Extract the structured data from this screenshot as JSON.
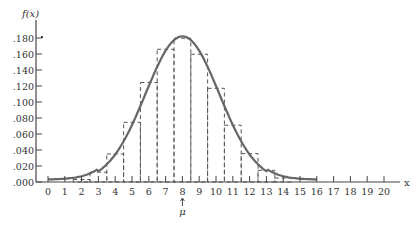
{
  "chart_data": {
    "type": "bar",
    "title": "",
    "xlabel": "x",
    "ylabel": "f(x)",
    "mu_label": "μ",
    "mu_value": 8,
    "categories": [
      0,
      1,
      2,
      3,
      4,
      5,
      6,
      7,
      8,
      9,
      10,
      11,
      12,
      13,
      14,
      15,
      16,
      17,
      18,
      19,
      20
    ],
    "x_tick_labels": [
      "0",
      "1",
      "2",
      "3",
      "4",
      "5",
      "6",
      "7",
      "8",
      "9",
      "10",
      "11",
      "12",
      "13",
      "14",
      "15",
      "16",
      "17",
      "18",
      "19",
      "20"
    ],
    "y_tick_labels": [
      ".000",
      ".020",
      ".040",
      ".060",
      ".080",
      ".100",
      ".120",
      ".140",
      ".160",
      ".180"
    ],
    "y_ticks": [
      0,
      0.02,
      0.04,
      0.06,
      0.08,
      0.1,
      0.12,
      0.14,
      0.16,
      0.18
    ],
    "ylim": [
      0,
      0.19
    ],
    "xlim": [
      0,
      20
    ],
    "values": [
      0.0,
      0.0005,
      0.0031,
      0.0123,
      0.035,
      0.0746,
      0.1244,
      0.1659,
      0.1797,
      0.1597,
      0.1171,
      0.071,
      0.0355,
      0.0146,
      0.0049,
      0.0013,
      0.0003,
      0,
      0,
      0,
      0
    ],
    "bar_style": "dashed outline",
    "curve": "normal approximation, solid line",
    "grid": false,
    "legend": null
  }
}
